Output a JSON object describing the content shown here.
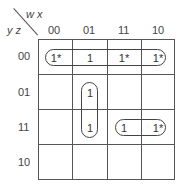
{
  "kmap": {
    "col_var_label": "w x",
    "row_var_label": "y z",
    "col_headers": [
      "00",
      "01",
      "11",
      "10"
    ],
    "row_headers": [
      "00",
      "01",
      "11",
      "10"
    ],
    "cells": [
      [
        "1*",
        "1",
        "1*",
        "1*"
      ],
      [
        "",
        "1",
        "",
        ""
      ],
      [
        "",
        "1",
        "1",
        "1*"
      ],
      [
        "",
        "",
        "",
        ""
      ]
    ],
    "groups": [
      {
        "name": "row-00-group",
        "cells": "row 00, cols 00-10"
      },
      {
        "name": "col-01-group",
        "cells": "rows 01-11, col 01"
      },
      {
        "name": "row-11-group",
        "cells": "row 11, cols 11-10"
      }
    ]
  }
}
